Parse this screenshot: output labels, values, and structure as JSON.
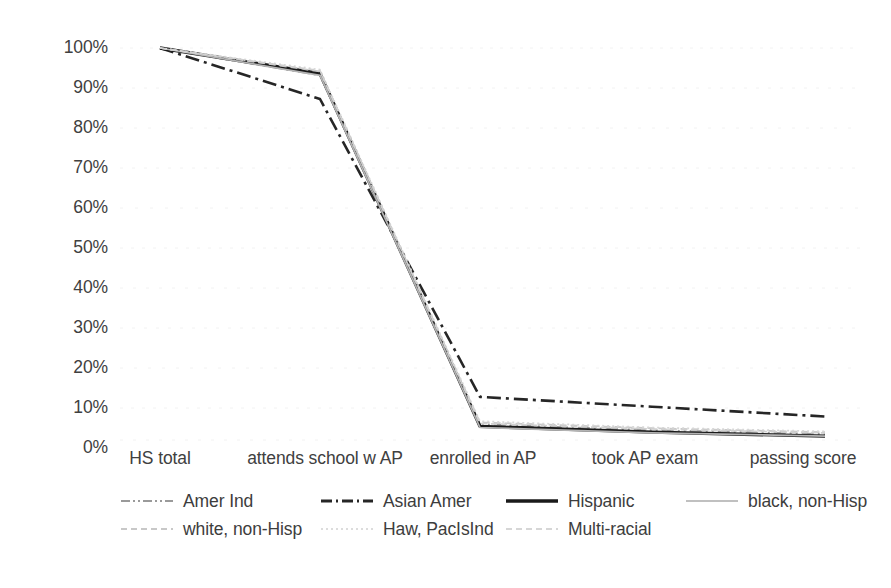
{
  "chart_data": {
    "type": "line",
    "title": "",
    "subtitle": "",
    "xlabel": "",
    "ylabel": "",
    "ylim": [
      0,
      100
    ],
    "ytick_labels": [
      "100%",
      "90%",
      "80%",
      "70%",
      "60%",
      "50%",
      "40%",
      "30%",
      "20%",
      "10%",
      "0%"
    ],
    "ytick_values": [
      100,
      90,
      80,
      70,
      60,
      50,
      40,
      30,
      20,
      10,
      0
    ],
    "categories": [
      "HS total",
      "attends school w AP",
      "enrolled in AP",
      "took AP exam",
      "passing score"
    ],
    "grid": "faint-horizontal",
    "legend_position": "bottom",
    "series": [
      {
        "name": "Amer Ind",
        "values": [
          100,
          93,
          4,
          2.5,
          1.5
        ],
        "color": "#9a9a9a",
        "dash": "12,4,2,4,2,4",
        "width": 1.9
      },
      {
        "name": "Asian Amer",
        "values": [
          100,
          87,
          11,
          8.5,
          6
        ],
        "color": "#262626",
        "dash": "14,5,3,5",
        "width": 2.6
      },
      {
        "name": "Hispanic",
        "values": [
          100,
          93.5,
          3.5,
          2,
          1
        ],
        "color": "#1a1a1a",
        "dash": "none",
        "width": 3.3
      },
      {
        "name": "black, non-Hisp",
        "values": [
          100,
          93,
          3.2,
          1.8,
          1
        ],
        "color": "#b4b4b4",
        "dash": "none",
        "width": 1.7
      },
      {
        "name": "white, non-Hisp",
        "values": [
          100,
          94,
          4.5,
          3,
          2
        ],
        "color": "#c8c8c8",
        "dash": "7,4",
        "width": 1.7
      },
      {
        "name": "Haw, PacIsInd",
        "values": [
          100,
          94.5,
          4.8,
          3.2,
          2.2
        ],
        "color": "#d8d8d8",
        "dash": "2,3",
        "width": 1.7
      },
      {
        "name": "Multi-racial",
        "values": [
          100,
          94.2,
          4.2,
          2.8,
          1.8
        ],
        "color": "#d0d0d0",
        "dash": "6,4",
        "width": 1.7
      }
    ]
  },
  "legend": {
    "items": [
      {
        "label": "Amer Ind"
      },
      {
        "label": "Asian Amer"
      },
      {
        "label": "Hispanic"
      },
      {
        "label": "black, non-Hisp"
      },
      {
        "label": "white, non-Hisp"
      },
      {
        "label": "Haw, PacIsInd"
      },
      {
        "label": "Multi-racial"
      }
    ]
  }
}
